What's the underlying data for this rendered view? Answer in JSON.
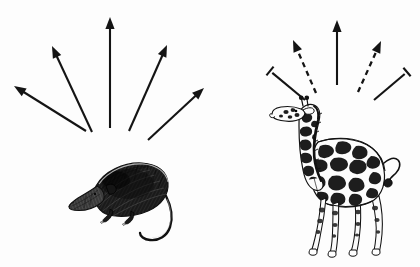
{
  "figure": {
    "type": "comparative-diagram",
    "background_color": "#fdfdfd",
    "ink_color": "#141414",
    "width": 420,
    "height": 267,
    "panels": [
      {
        "id": "left-panel",
        "name": "shrew-panel",
        "animal": {
          "name": "shrew",
          "semantic": "small-mammal-shrew",
          "facing": "left",
          "fill_style": "dense-dark-hatching",
          "position": {
            "x": 70,
            "y": 160,
            "width": 100,
            "height": 78
          }
        },
        "rays": [
          {
            "id": "L1",
            "style": "solid",
            "tip": "arrowhead",
            "x1": 86,
            "y1": 131,
            "x2": 14,
            "y2": 86,
            "angle_deg": 148
          },
          {
            "id": "L2",
            "style": "solid",
            "tip": "arrowhead",
            "x1": 92,
            "y1": 132,
            "x2": 52,
            "y2": 46,
            "angle_deg": 115
          },
          {
            "id": "L3",
            "style": "solid",
            "tip": "arrowhead",
            "x1": 110,
            "y1": 128,
            "x2": 110,
            "y2": 17,
            "angle_deg": 90
          },
          {
            "id": "L4",
            "style": "solid",
            "tip": "arrowhead",
            "x1": 129,
            "y1": 131,
            "x2": 167,
            "y2": 45,
            "angle_deg": 66
          },
          {
            "id": "L5",
            "style": "solid",
            "tip": "arrowhead",
            "x1": 148,
            "y1": 140,
            "x2": 204,
            "y2": 88,
            "angle_deg": 43
          }
        ],
        "ray_summary": {
          "total": 5,
          "solid_arrows": 5,
          "dashed_arrows": 0,
          "blocked_caps": 0
        }
      },
      {
        "id": "right-panel",
        "name": "giraffe-panel",
        "animal": {
          "name": "giraffe",
          "semantic": "large-mammal-giraffe",
          "facing": "left",
          "fill_style": "spotted-coat-outline",
          "position": {
            "x": 272,
            "y": 95,
            "width": 120,
            "height": 158
          }
        },
        "rays": [
          {
            "id": "R1",
            "style": "solid",
            "tip": "t-bar-block",
            "x1": 305,
            "y1": 100,
            "x2": 270,
            "y2": 71,
            "angle_deg": 140
          },
          {
            "id": "R2",
            "style": "dashed",
            "tip": "arrowhead",
            "x1": 316,
            "y1": 93,
            "x2": 293,
            "y2": 40,
            "angle_deg": 114
          },
          {
            "id": "R3",
            "style": "solid",
            "tip": "arrowhead",
            "x1": 337,
            "y1": 85,
            "x2": 337,
            "y2": 20,
            "angle_deg": 90
          },
          {
            "id": "R4",
            "style": "dashed",
            "tip": "arrowhead",
            "x1": 358,
            "y1": 92,
            "x2": 381,
            "y2": 41,
            "angle_deg": 66
          },
          {
            "id": "R5",
            "style": "solid",
            "tip": "t-bar-block",
            "x1": 374,
            "y1": 100,
            "x2": 407,
            "y2": 72,
            "angle_deg": 40
          }
        ],
        "ray_summary": {
          "total": 5,
          "solid_arrows": 1,
          "dashed_arrows": 2,
          "blocked_caps": 2
        }
      }
    ]
  },
  "labels": {
    "title": "",
    "caption": "",
    "left_label": "",
    "right_label": ""
  }
}
